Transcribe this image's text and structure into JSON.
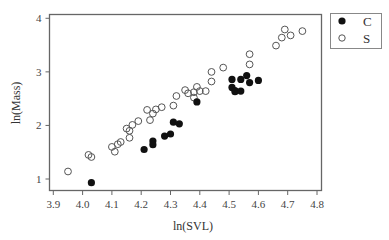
{
  "chart_data": {
    "type": "scatter",
    "title": "",
    "xlabel": "ln(SVL)",
    "ylabel": "ln(Mass)",
    "xlim": [
      3.88,
      4.818
    ],
    "ylim": [
      0.78,
      4.08
    ],
    "x_ticks": [
      3.9,
      4.0,
      4.1,
      4.2,
      4.3,
      4.4,
      4.5,
      4.6,
      4.7,
      4.8
    ],
    "x_tick_labels": [
      "3.9",
      "4.0",
      "4.1",
      "4.2",
      "4.3",
      "4.4",
      "4.5",
      "4.6",
      "4.7",
      "4.8"
    ],
    "y_ticks": [
      1,
      2,
      3,
      4
    ],
    "y_tick_labels": [
      "1",
      "2",
      "3",
      "4"
    ],
    "grid": false,
    "legend_position": "outside-top-right",
    "series": [
      {
        "name": "C",
        "marker": "filled-circle",
        "color": "#111111",
        "points": [
          [
            4.03,
            0.93
          ],
          [
            4.21,
            1.55
          ],
          [
            4.24,
            1.71
          ],
          [
            4.24,
            1.64
          ],
          [
            4.28,
            1.8
          ],
          [
            4.3,
            1.84
          ],
          [
            4.31,
            2.06
          ],
          [
            4.33,
            2.03
          ],
          [
            4.39,
            2.44
          ],
          [
            4.51,
            2.86
          ],
          [
            4.51,
            2.71
          ],
          [
            4.52,
            2.65
          ],
          [
            4.52,
            2.63
          ],
          [
            4.54,
            2.64
          ],
          [
            4.54,
            2.86
          ],
          [
            4.56,
            2.93
          ],
          [
            4.57,
            2.8
          ],
          [
            4.6,
            2.84
          ]
        ]
      },
      {
        "name": "S",
        "marker": "open-circle",
        "color": "#555555",
        "points": [
          [
            3.95,
            1.14
          ],
          [
            4.02,
            1.45
          ],
          [
            4.03,
            1.41
          ],
          [
            4.1,
            1.6
          ],
          [
            4.11,
            1.51
          ],
          [
            4.12,
            1.65
          ],
          [
            4.13,
            1.69
          ],
          [
            4.15,
            1.94
          ],
          [
            4.16,
            1.9
          ],
          [
            4.16,
            1.77
          ],
          [
            4.17,
            2.01
          ],
          [
            4.19,
            2.08
          ],
          [
            4.22,
            2.29
          ],
          [
            4.23,
            2.1
          ],
          [
            4.24,
            2.22
          ],
          [
            4.25,
            2.3
          ],
          [
            4.27,
            2.34
          ],
          [
            4.31,
            2.37
          ],
          [
            4.32,
            2.55
          ],
          [
            4.35,
            2.66
          ],
          [
            4.36,
            2.6
          ],
          [
            4.38,
            2.62
          ],
          [
            4.39,
            2.72
          ],
          [
            4.4,
            2.64
          ],
          [
            4.42,
            2.64
          ],
          [
            4.38,
            2.52
          ],
          [
            4.44,
            2.82
          ],
          [
            4.44,
            3.0
          ],
          [
            4.48,
            3.08
          ],
          [
            4.57,
            3.33
          ],
          [
            4.57,
            3.14
          ],
          [
            4.66,
            3.49
          ],
          [
            4.68,
            3.64
          ],
          [
            4.69,
            3.79
          ],
          [
            4.71,
            3.68
          ],
          [
            4.75,
            3.76
          ]
        ]
      }
    ]
  },
  "legend": {
    "items": [
      {
        "label": "C",
        "marker": "filled-circle"
      },
      {
        "label": "S",
        "marker": "open-circle"
      }
    ]
  }
}
